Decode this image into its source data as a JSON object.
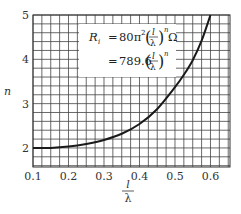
{
  "chart_data": {
    "type": "line",
    "title": "",
    "xlabel": "l/λ",
    "ylabel": "n",
    "xlim": [
      0.1,
      0.655
    ],
    "ylim": [
      1.57,
      5.0
    ],
    "grid": true,
    "grid_x_step": 0.025,
    "grid_y_step": 0.2,
    "x_ticks": [
      "0.1",
      "0.2",
      "0.3",
      "0.4",
      "0.5",
      "0.6"
    ],
    "x_tick_values": [
      0.1,
      0.2,
      0.3,
      0.4,
      0.5,
      0.6
    ],
    "y_ticks": [
      "2",
      "3",
      "4",
      "5"
    ],
    "y_tick_values": [
      2,
      3,
      4,
      5
    ],
    "series": [
      {
        "name": "n vs l/λ",
        "x": [
          0.1,
          0.15,
          0.2,
          0.25,
          0.3,
          0.35,
          0.4,
          0.45,
          0.5,
          0.525,
          0.55,
          0.575,
          0.6
        ],
        "y": [
          2.0,
          2.0,
          2.03,
          2.09,
          2.18,
          2.32,
          2.54,
          2.88,
          3.37,
          3.65,
          3.98,
          4.42,
          5.0
        ]
      }
    ],
    "annotation": {
      "line1": {
        "lhs": "R",
        "sub": "i",
        "eq": "=",
        "coef": "80π",
        "sup2": "2",
        "frac_num": "l",
        "frac_den": "λ",
        "exp": "n",
        "unit": "Ω"
      },
      "line2": {
        "eq": "=",
        "coef": "789.6",
        "frac_num": "l",
        "frac_den": "λ",
        "exp": "n"
      }
    }
  }
}
